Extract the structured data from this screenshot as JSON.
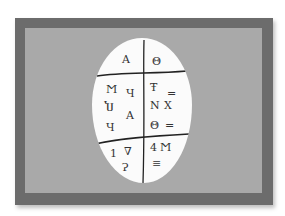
{
  "scene": {
    "description": "Photograph of an oval white tablet with inscribed symbols mounted on a gray mat in a dark gray frame",
    "colors": {
      "background": "#ffffff",
      "frame": "#6c6c6c",
      "mat": "#a9a9a9",
      "tablet": "#fbfbfb",
      "ink": "#333333"
    }
  },
  "tablet": {
    "top_left": [
      "A"
    ],
    "top_right": [
      "Θ"
    ],
    "middle_left": [
      "Ϻ",
      "Ч",
      "Ⴎ",
      "A",
      "Ч"
    ],
    "middle_right": [
      "Ŧ",
      "=",
      "Ν",
      "Χ",
      "Θ",
      "="
    ],
    "bottom_left": [
      "1",
      "∇",
      "Ɂ"
    ],
    "bottom_right": [
      "4",
      "Ϻ",
      "≡"
    ]
  }
}
